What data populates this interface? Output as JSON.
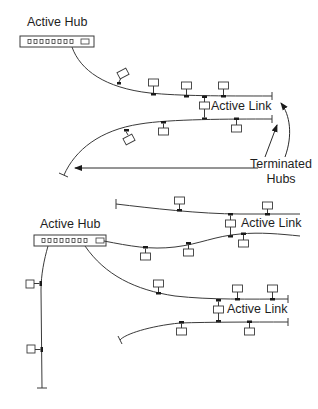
{
  "colors": {
    "line": "#3a3a3a",
    "text": "#1e1e1e",
    "background": "#ffffff"
  },
  "top_diagram": {
    "hub_label": "Active Hub",
    "active_link_label": "Active Link",
    "terminated_label_line1": "Terminated",
    "terminated_label_line2": "Hubs",
    "hub_port_count": 8
  },
  "bottom_diagram": {
    "hub_label": "Active Hub",
    "active_link_labels": [
      "Active Link",
      "Active Link"
    ],
    "hub_port_count": 8
  }
}
